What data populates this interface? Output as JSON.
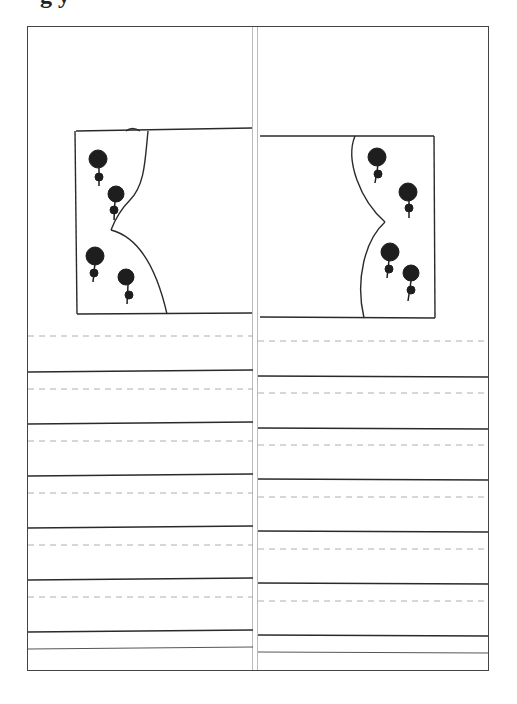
{
  "header": {
    "title_fragment": "g  y"
  },
  "drawing": {
    "left_panel": {
      "description": "rectangle with curved curtain edge and four roses on left"
    },
    "right_panel": {
      "description": "rectangle with curved curtain edge and four roses on right"
    },
    "ruled_lines_count": 6
  },
  "colors": {
    "ink": "#2a2a2a",
    "paper": "#ffffff"
  }
}
